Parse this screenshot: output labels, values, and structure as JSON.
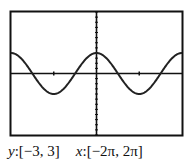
{
  "chart_data": {
    "type": "line",
    "title": "",
    "function": "y = cos(x)",
    "series": [
      {
        "name": "cos(x)",
        "amplitude": 1,
        "period": "2π",
        "peaks_at": [
          0,
          "±2π"
        ],
        "troughs_at": [
          "-π",
          "π"
        ],
        "zeros_at": [
          "-3π/2",
          "-π/2",
          "π/2",
          "3π/2"
        ]
      }
    ],
    "xlim": [
      -6.2832,
      6.2832
    ],
    "ylim": [
      -3,
      3
    ],
    "xlabel": "",
    "ylabel": "",
    "x_ticks": [
      "-π",
      "π"
    ],
    "y_tick_step": 0.25,
    "grid": false,
    "legend": null
  },
  "caption": {
    "y_var": "y",
    "y_range": ":[−3, 3]",
    "x_var": "x",
    "x_range": ":[−2π, 2π]"
  },
  "colors": {
    "frame": "#111111",
    "axis": "#111111",
    "curve": "#222222",
    "background": "#ffffff"
  }
}
